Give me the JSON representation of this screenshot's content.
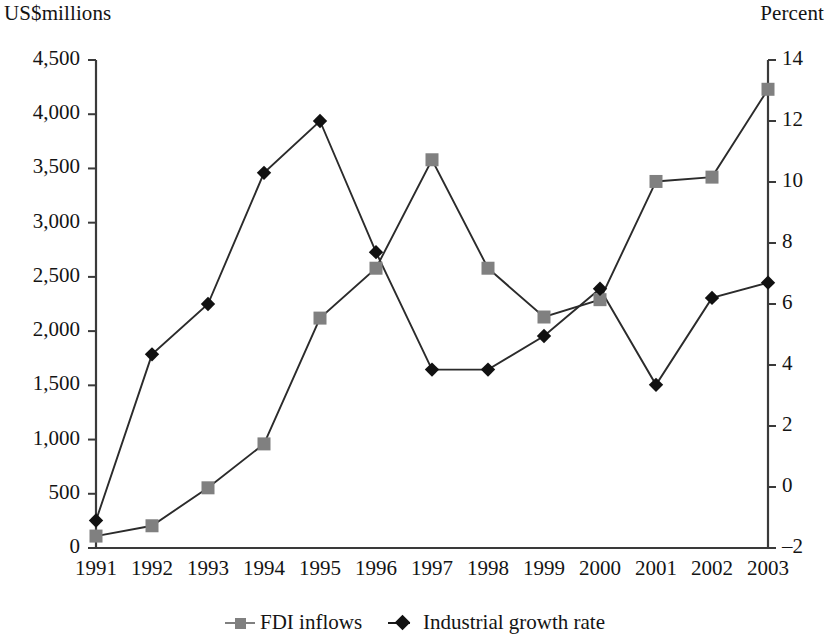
{
  "figure": {
    "left_axis_title": "US$millions",
    "right_axis_title": "Percent"
  },
  "legend": {
    "items": [
      {
        "label": "FDI inflows",
        "marker": "square",
        "color": "#808080"
      },
      {
        "label": "Industrial growth rate",
        "marker": "diamond",
        "color": "#111111"
      }
    ]
  },
  "axes": {
    "left_ticks": [
      "0",
      "500",
      "1,000",
      "1,500",
      "2,000",
      "2,500",
      "3,000",
      "3,500",
      "4,000",
      "4,500"
    ],
    "right_ticks": [
      "-2",
      "0",
      "2",
      "4",
      "6",
      "8",
      "10",
      "12",
      "14"
    ],
    "x_ticks": [
      "1991",
      "1992",
      "1993",
      "1994",
      "1995",
      "1996",
      "1997",
      "1998",
      "1999",
      "2000",
      "2001",
      "2002",
      "2003"
    ]
  },
  "chart_data": {
    "type": "line",
    "title": "",
    "xlabel": "",
    "grid": false,
    "legend_position": "bottom",
    "categories": [
      "1991",
      "1992",
      "1993",
      "1994",
      "1995",
      "1996",
      "1997",
      "1998",
      "1999",
      "2000",
      "2001",
      "2002",
      "2003"
    ],
    "series": [
      {
        "name": "FDI inflows",
        "axis": "left",
        "ylabel": "US$millions",
        "ylim": [
          0,
          4500
        ],
        "color": "#808080",
        "marker": "square",
        "values": [
          110,
          205,
          555,
          960,
          2120,
          2580,
          3580,
          2580,
          2130,
          2290,
          3380,
          3420,
          4230
        ]
      },
      {
        "name": "Industrial growth rate",
        "axis": "right",
        "ylabel": "Percent",
        "ylim": [
          -2,
          14
        ],
        "color": "#111111",
        "marker": "diamond",
        "values": [
          -1.1,
          4.35,
          6.0,
          10.3,
          12.0,
          7.7,
          3.85,
          3.85,
          4.95,
          6.5,
          3.35,
          6.2,
          6.7
        ]
      }
    ]
  }
}
